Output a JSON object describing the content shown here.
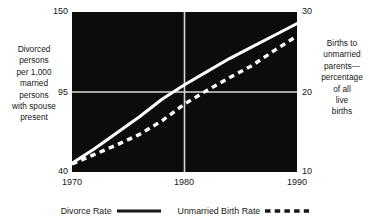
{
  "chart_data": {
    "type": "line",
    "title": "",
    "subtitle": "",
    "xlabel": "",
    "x_ticks": [
      "1970",
      "1980",
      "1990"
    ],
    "xlim": [
      1970,
      1990
    ],
    "grid": true,
    "grid_lines": {
      "vertical_at_x": 1980,
      "horizontal_at_left_y": 95,
      "horizontal_at_right_y": 20
    },
    "legend_position": "bottom-center",
    "axes": [
      {
        "id": "left",
        "label": "Divorced persons per 1,000 married persons with spouse present",
        "ticks": [
          40,
          95,
          150
        ],
        "ylim": [
          40,
          150
        ],
        "series_id": "divorce-rate"
      },
      {
        "id": "right",
        "label": "Births to unmarried parents—percentage of all live births",
        "ticks": [
          10,
          20,
          30
        ],
        "ylim": [
          10,
          30
        ],
        "series_id": "unmarried-birth-rate"
      }
    ],
    "series": [
      {
        "name": "Divorce Rate",
        "axis": "left",
        "style": "solid",
        "color": "#ffffff",
        "x": [
          1970,
          1972,
          1974,
          1976,
          1978,
          1980,
          1982,
          1984,
          1986,
          1988,
          1990
        ],
        "values": [
          46,
          56,
          67,
          78,
          90,
          100,
          109,
          118,
          126,
          134,
          142
        ]
      },
      {
        "name": "Unmarried Birth Rate",
        "axis": "right",
        "style": "dashed",
        "color": "#ffffff",
        "x": [
          1970,
          1972,
          1974,
          1976,
          1978,
          1980,
          1982,
          1984,
          1986,
          1988,
          1990
        ],
        "values": [
          11.0,
          12.2,
          13.4,
          14.7,
          16.4,
          18.5,
          20.2,
          21.8,
          23.3,
          25.2,
          27.0
        ]
      }
    ]
  },
  "axis_captions": {
    "left": "Divorced\npersons\nper 1,000\nmarried\npersons\nwith spouse\npresent",
    "right": "Births to\nunmarried\nparents—\npercentage\nof all\nlive\nbirths"
  },
  "ticks": {
    "left": {
      "top": "150",
      "mid": "95",
      "bottom": "40"
    },
    "right": {
      "top": "30",
      "mid": "20",
      "bottom": "10"
    },
    "x": {
      "first": "1970",
      "second": "1980",
      "third": "1990"
    }
  },
  "legend": {
    "entries": [
      {
        "label": "Divorce Rate",
        "style": "solid",
        "icon": "solid-line-icon"
      },
      {
        "label": "Unmarried Birth Rate",
        "style": "dashed",
        "icon": "dashed-line-icon"
      }
    ]
  },
  "colors": {
    "plot_background": "#0c0c0c",
    "line": "#ffffff",
    "gridline": "#d8d8d8",
    "text": "#171717",
    "page_background": "#ffffff"
  }
}
